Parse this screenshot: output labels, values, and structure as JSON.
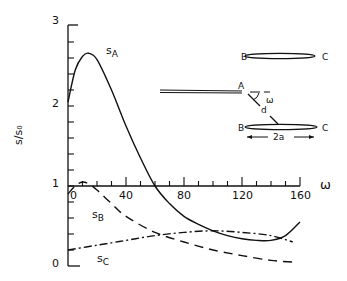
{
  "chart_data": {
    "type": "line",
    "title": "",
    "xlabel": "ω",
    "ylabel": "s/s₀",
    "xlim": [
      0,
      160
    ],
    "ylim": [
      0,
      3
    ],
    "x_ticks": [
      "0",
      "40",
      "80",
      "120",
      "160"
    ],
    "y_ticks": [
      "0",
      "1",
      "2",
      "3"
    ],
    "grid": false,
    "legend": "inline labels",
    "series": [
      {
        "name": "s_A",
        "label": "s",
        "sub": "A",
        "style": "solid",
        "x": [
          0,
          5,
          10,
          14,
          20,
          30,
          40,
          50,
          60,
          70,
          80,
          90,
          100,
          110,
          120,
          130,
          140,
          150,
          160
        ],
        "values": [
          2.05,
          2.45,
          2.62,
          2.66,
          2.58,
          2.2,
          1.75,
          1.35,
          1.0,
          0.78,
          0.62,
          0.52,
          0.44,
          0.38,
          0.34,
          0.32,
          0.32,
          0.38,
          0.55
        ]
      },
      {
        "name": "s_B",
        "label": "s",
        "sub": "B",
        "style": "dashed",
        "x": [
          0,
          5,
          10,
          15,
          20,
          30,
          40,
          60,
          80,
          100,
          120,
          140,
          155
        ],
        "values": [
          0.9,
          1.0,
          1.05,
          1.02,
          0.95,
          0.78,
          0.62,
          0.42,
          0.3,
          0.2,
          0.13,
          0.07,
          0.05
        ]
      },
      {
        "name": "s_C",
        "label": "s",
        "sub": "C",
        "style": "dash-dot",
        "x": [
          0,
          20,
          40,
          60,
          80,
          100,
          120,
          140,
          155
        ],
        "values": [
          0.2,
          0.26,
          0.32,
          0.38,
          0.42,
          0.44,
          0.42,
          0.38,
          0.3
        ]
      }
    ],
    "annotations": {
      "inset_labels": [
        "B",
        "C",
        "A",
        "ω",
        "d",
        "B",
        "C",
        "2a"
      ]
    }
  },
  "axes": {
    "x_label": "ω",
    "y_label": "s/s₀",
    "x_ticks": [
      "0",
      "40",
      "80",
      "120",
      "160"
    ],
    "y_ticks": [
      "0",
      "1",
      "2",
      "3"
    ]
  },
  "curve_labels": {
    "a": {
      "main": "s",
      "sub": "A"
    },
    "b": {
      "main": "s",
      "sub": "B"
    },
    "c": {
      "main": "s",
      "sub": "C"
    }
  },
  "inset": {
    "top_b": "B",
    "top_c": "C",
    "a": "A",
    "omega": "ω",
    "d": "d",
    "bot_b": "B",
    "bot_c": "C",
    "width": "2a"
  }
}
